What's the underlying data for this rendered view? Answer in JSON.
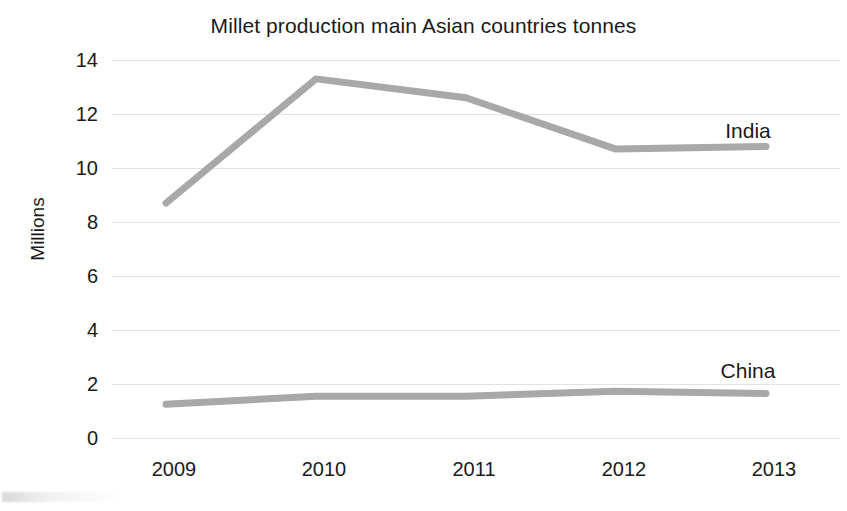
{
  "chart_data": {
    "type": "line",
    "title": "Millet production main Asian countries tonnes",
    "xlabel": "",
    "ylabel": "Millions",
    "categories": [
      "2009",
      "2010",
      "2011",
      "2012",
      "2013"
    ],
    "ylim": [
      0,
      14
    ],
    "ytick_labels": [
      "14",
      "12",
      "10",
      "8",
      "6",
      "4",
      "2",
      "0"
    ],
    "ytick_values": [
      14,
      12,
      10,
      8,
      6,
      4,
      2,
      0
    ],
    "grid": true,
    "legend_position": "inline-right",
    "series": [
      {
        "name": "India",
        "label": "India",
        "color": "#a8a8a8",
        "values": [
          8.7,
          13.3,
          12.6,
          10.7,
          10.8
        ]
      },
      {
        "name": "China",
        "label": "China",
        "color": "#a8a8a8",
        "values": [
          1.25,
          1.55,
          1.55,
          1.73,
          1.65
        ]
      }
    ]
  }
}
